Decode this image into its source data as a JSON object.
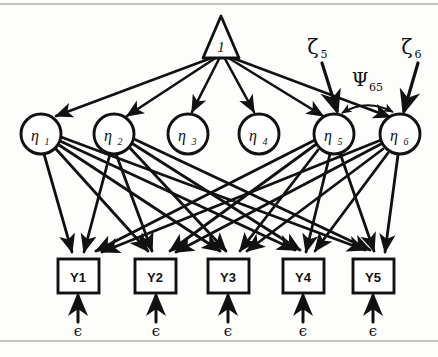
{
  "figure": {
    "kind": "sem-path-diagram",
    "title_text": "",
    "colors": {
      "ink": "#111111",
      "background": "#fdfdfb",
      "rule": "#8a8a8a"
    },
    "rules": {
      "top_y": 4,
      "bottom_y": 341
    }
  },
  "constant_node": {
    "label": "1",
    "shape": "triangle",
    "apex": {
      "x": 221,
      "y": 16
    },
    "base_left": {
      "x": 203,
      "y": 58
    },
    "base_right": {
      "x": 239,
      "y": 58
    }
  },
  "latent_nodes": [
    {
      "id": "eta1",
      "base": "η",
      "sub": "1",
      "cx": 41,
      "cy": 134,
      "r": 20
    },
    {
      "id": "eta2",
      "base": "η",
      "sub": "2",
      "cx": 114,
      "cy": 134,
      "r": 20
    },
    {
      "id": "eta3",
      "base": "η",
      "sub": "3",
      "cx": 188,
      "cy": 134,
      "r": 20
    },
    {
      "id": "eta4",
      "base": "η",
      "sub": "4",
      "cx": 259,
      "cy": 134,
      "r": 20
    },
    {
      "id": "eta5",
      "base": "η",
      "sub": "5",
      "cx": 334,
      "cy": 134,
      "r": 20
    },
    {
      "id": "eta6",
      "base": "η",
      "sub": "6",
      "cx": 400,
      "cy": 134,
      "r": 20
    }
  ],
  "indicator_boxes": [
    {
      "id": "Y1",
      "label": "Y1",
      "x": 58,
      "y": 259,
      "w": 41,
      "h": 34
    },
    {
      "id": "Y2",
      "label": "Y2",
      "x": 135,
      "y": 259,
      "w": 41,
      "h": 34
    },
    {
      "id": "Y3",
      "label": "Y3",
      "x": 208,
      "y": 259,
      "w": 41,
      "h": 34
    },
    {
      "id": "Y4",
      "label": "Y4",
      "x": 283,
      "y": 259,
      "w": 41,
      "h": 34
    },
    {
      "id": "Y5",
      "label": "Y5",
      "x": 353,
      "y": 259,
      "w": 41,
      "h": 34
    }
  ],
  "disturbances": [
    {
      "id": "zeta5",
      "label": "ζ5",
      "base": "ζ",
      "sub": "5",
      "label_x": 318,
      "label_y": 52,
      "target": "eta5",
      "arrow_from": {
        "x": 323,
        "y": 62
      },
      "arrow_to": {
        "x": 338,
        "y": 110
      }
    },
    {
      "id": "zeta6",
      "label": "ζ6",
      "base": "ζ",
      "sub": "6",
      "label_x": 412,
      "label_y": 52,
      "target": "eta6",
      "arrow_from": {
        "x": 417,
        "y": 62
      },
      "arrow_to": {
        "x": 404,
        "y": 110
      }
    }
  ],
  "covariance": {
    "id": "psi65",
    "base": "Ψ",
    "sub": "65",
    "label_x": 366,
    "label_y": 84,
    "from": "eta5",
    "to": "eta6",
    "double_headed": true
  },
  "measurement_errors": [
    {
      "id": "eps1",
      "label": "ϵ",
      "label_x": 78,
      "label_y": 334,
      "arrow_x": 78,
      "arrow_from_y": 322,
      "arrow_to_y": 296
    },
    {
      "id": "eps2",
      "label": "ϵ",
      "label_x": 156,
      "label_y": 334,
      "arrow_x": 156,
      "arrow_from_y": 322,
      "arrow_to_y": 296
    },
    {
      "id": "eps3",
      "label": "ϵ",
      "label_x": 228,
      "label_y": 334,
      "arrow_x": 228,
      "arrow_from_y": 322,
      "arrow_to_y": 296
    },
    {
      "id": "eps4",
      "label": "ϵ",
      "label_x": 303,
      "label_y": 334,
      "arrow_x": 303,
      "arrow_from_y": 322,
      "arrow_to_y": 296
    },
    {
      "id": "eps5",
      "label": "ϵ",
      "label_x": 373,
      "label_y": 334,
      "arrow_x": 373,
      "arrow_from_y": 322,
      "arrow_to_y": 296
    }
  ],
  "edges_from_constant": [
    {
      "from": "1",
      "to": "eta1"
    },
    {
      "from": "1",
      "to": "eta2"
    },
    {
      "from": "1",
      "to": "eta3"
    },
    {
      "from": "1",
      "to": "eta4"
    },
    {
      "from": "1",
      "to": "eta5"
    },
    {
      "from": "1",
      "to": "eta6"
    }
  ],
  "edges_latent_to_indicator": [
    {
      "from": "eta1",
      "to": "Y1"
    },
    {
      "from": "eta1",
      "to": "Y2"
    },
    {
      "from": "eta1",
      "to": "Y3"
    },
    {
      "from": "eta1",
      "to": "Y4"
    },
    {
      "from": "eta1",
      "to": "Y5"
    },
    {
      "from": "eta2",
      "to": "Y1"
    },
    {
      "from": "eta2",
      "to": "Y2"
    },
    {
      "from": "eta2",
      "to": "Y3"
    },
    {
      "from": "eta2",
      "to": "Y4"
    },
    {
      "from": "eta2",
      "to": "Y5"
    },
    {
      "from": "eta5",
      "to": "Y1"
    },
    {
      "from": "eta5",
      "to": "Y2"
    },
    {
      "from": "eta5",
      "to": "Y3"
    },
    {
      "from": "eta5",
      "to": "Y4"
    },
    {
      "from": "eta5",
      "to": "Y5"
    },
    {
      "from": "eta6",
      "to": "Y1"
    },
    {
      "from": "eta6",
      "to": "Y2"
    },
    {
      "from": "eta6",
      "to": "Y3"
    },
    {
      "from": "eta6",
      "to": "Y4"
    },
    {
      "from": "eta6",
      "to": "Y5"
    }
  ]
}
